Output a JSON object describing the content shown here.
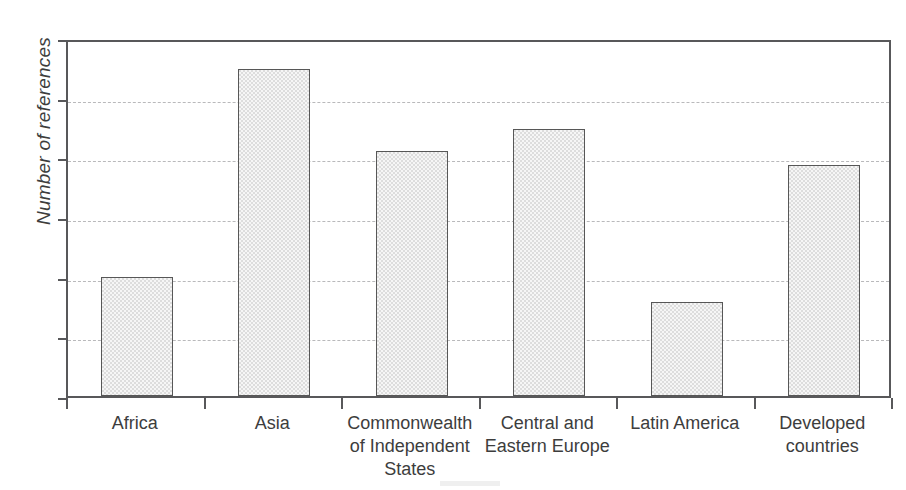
{
  "chart_data": {
    "type": "bar",
    "title": "",
    "subtitle": "",
    "xlabel": "",
    "ylabel": "Number of references",
    "categories": [
      "Africa",
      "Commonwealth of Independent States",
      "Asia",
      "Central and Eastern Europe",
      "Latin America",
      "Developed countries"
    ],
    "category_lines": [
      [
        "Africa"
      ],
      [
        "Asia"
      ],
      [
        "Commonwealth",
        "of Independent",
        "States"
      ],
      [
        "Central and",
        "Eastern Europe"
      ],
      [
        "Latin America"
      ],
      [
        "Developed",
        "countries"
      ]
    ],
    "bars": [
      {
        "label": "Africa",
        "value": 20.0
      },
      {
        "label": "Asia",
        "value": 54.8
      },
      {
        "label": "Commonwealth of Independent States",
        "value": 41.0
      },
      {
        "label": "Central and Eastern Europe",
        "value": 44.8
      },
      {
        "label": "Latin America",
        "value": 15.7
      },
      {
        "label": "Developed countries",
        "value": 38.7
      }
    ],
    "values": [
      20.0,
      54.8,
      41.0,
      44.8,
      15.7,
      38.7
    ],
    "ylim": [
      0,
      60
    ],
    "y_ticks": [
      0,
      10,
      20,
      30,
      40,
      50,
      60
    ],
    "y_tick_labels": [
      "0",
      "10",
      "20",
      "30",
      "40",
      "50",
      "60"
    ],
    "grid": true,
    "grid_style": "dashed-horizontal",
    "legend": false,
    "legend_position": "none",
    "colors": {
      "bar_fill": "#dddddd",
      "bar_edge": "#575757",
      "axis": "#58585a",
      "gridline": "#b9b9bb",
      "text": "#3d3d3d",
      "background": "#ffffff"
    }
  }
}
